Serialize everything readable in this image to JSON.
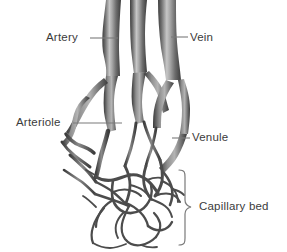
{
  "figure": {
    "background_color": "#ffffff",
    "line_color": "#6e6e6e",
    "text_color": "#3b3b3b",
    "vessel_dark": "#4a4a4a",
    "vessel_mid": "#7a7a7a",
    "vessel_light": "#c2c2c2"
  },
  "labels": {
    "artery": "Artery",
    "vein": "Vein",
    "arteriole": "Arteriole",
    "venule": "Venule",
    "capillary_bed": "Capillary bed"
  }
}
